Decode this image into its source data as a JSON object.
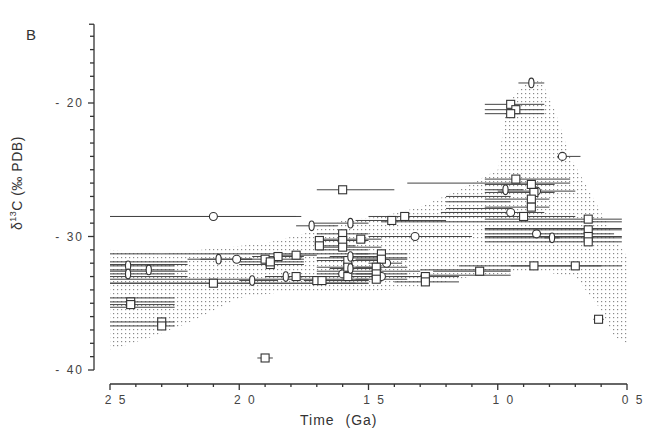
{
  "panel_label": "B",
  "axes": {
    "ylabel_delta": "δ",
    "ylabel_sup": "13",
    "ylabel_rest": "C (‰ PDB)",
    "xlabel": "Time (Ga)"
  },
  "chart_data": {
    "type": "scatter",
    "title": "",
    "panel": "B",
    "xlabel": "Time (Ga)",
    "ylabel": "δ13C (‰ PDB)",
    "xlim": [
      2.5,
      0.5
    ],
    "ylim": [
      -40,
      -14
    ],
    "x_reversed": true,
    "x_ticks": [
      2.5,
      2.0,
      1.5,
      1.0,
      0.5
    ],
    "x_tick_labels": [
      "2 5",
      "2 0",
      "1 5",
      "1 0",
      "0 5"
    ],
    "x_minor_step": 0.1,
    "y_ticks": [
      -20,
      -30,
      -40
    ],
    "y_tick_labels": [
      "- 20",
      "- 30",
      "- 40"
    ],
    "y_minor_step": 1,
    "grid": false,
    "legend": null,
    "envelope": {
      "description": "stippled envelope of organic carbon isotope values",
      "points": [
        [
          2.5,
          -31.0
        ],
        [
          2.3,
          -31.3
        ],
        [
          2.1,
          -30.9
        ],
        [
          1.9,
          -30.5
        ],
        [
          1.75,
          -29.8
        ],
        [
          1.6,
          -28.8
        ],
        [
          1.45,
          -28.5
        ],
        [
          1.3,
          -27.8
        ],
        [
          1.15,
          -26.5
        ],
        [
          1.0,
          -25.0
        ],
        [
          0.97,
          -20.5
        ],
        [
          0.93,
          -19.2
        ],
        [
          0.88,
          -18.3
        ],
        [
          0.83,
          -18.4
        ],
        [
          0.78,
          -20.5
        ],
        [
          0.72,
          -24.0
        ],
        [
          0.62,
          -27.5
        ],
        [
          0.55,
          -30.0
        ],
        [
          0.5,
          -31.5
        ],
        [
          0.5,
          -38.0
        ],
        [
          0.55,
          -37.5
        ],
        [
          0.6,
          -35.5
        ],
        [
          0.7,
          -33.0
        ],
        [
          0.85,
          -32.6
        ],
        [
          1.1,
          -33.0
        ],
        [
          1.3,
          -33.8
        ],
        [
          1.5,
          -34.1
        ],
        [
          1.7,
          -34.2
        ],
        [
          1.85,
          -34.2
        ],
        [
          2.0,
          -34.6
        ],
        [
          2.2,
          -36.5
        ],
        [
          2.35,
          -37.6
        ],
        [
          2.5,
          -38.5
        ]
      ]
    },
    "series": [
      {
        "name": "circles",
        "marker": "circle",
        "points": [
          {
            "x": 2.1,
            "y": -28.5,
            "xmin": 2.5,
            "xmax": 1.76
          },
          {
            "x": 1.32,
            "y": -30.0,
            "xmin": 1.5,
            "xmax": 1.1
          },
          {
            "x": 0.95,
            "y": -28.2,
            "xmin": 1.22,
            "xmax": 0.82
          },
          {
            "x": 0.75,
            "y": -24.0,
            "xmin": 0.77,
            "xmax": 0.68
          },
          {
            "x": 0.85,
            "y": -29.8,
            "xmin": 1.05,
            "xmax": 0.55
          },
          {
            "x": 2.01,
            "y": -31.7,
            "xmin": 2.15,
            "xmax": 1.95
          },
          {
            "x": 1.43,
            "y": -32.0,
            "xmin": 1.5,
            "xmax": 1.37
          },
          {
            "x": 1.45,
            "y": -33.0,
            "xmin": 1.6,
            "xmax": 1.3
          },
          {
            "x": 1.6,
            "y": -32.8,
            "xmin": 1.7,
            "xmax": 1.45
          },
          {
            "x": 0.85,
            "y": -26.6,
            "xmin": 1.0,
            "xmax": 0.7
          }
        ]
      },
      {
        "name": "squares",
        "marker": "square",
        "points": [
          {
            "x": 1.6,
            "y": -26.5,
            "xmin": 1.7,
            "xmax": 1.4
          },
          {
            "x": 0.95,
            "y": -20.1,
            "xmin": 1.05,
            "xmax": 0.82
          },
          {
            "x": 0.93,
            "y": -20.5,
            "xmin": 1.05,
            "xmax": 0.82
          },
          {
            "x": 0.95,
            "y": -20.8,
            "xmin": 1.05,
            "xmax": 0.82
          },
          {
            "x": 0.93,
            "y": -25.7,
            "xmin": 1.05,
            "xmax": 0.72
          },
          {
            "x": 0.87,
            "y": -26.1,
            "xmin": 1.05,
            "xmax": 0.78
          },
          {
            "x": 0.86,
            "y": -26.7,
            "xmin": 1.05,
            "xmax": 0.78
          },
          {
            "x": 0.87,
            "y": -27.2,
            "xmin": 1.05,
            "xmax": 0.8
          },
          {
            "x": 0.87,
            "y": -27.8,
            "xmin": 1.05,
            "xmax": 0.8
          },
          {
            "x": 0.65,
            "y": -28.7,
            "xmin": 1.05,
            "xmax": 0.52
          },
          {
            "x": 0.65,
            "y": -29.5,
            "xmin": 1.05,
            "xmax": 0.52
          },
          {
            "x": 0.65,
            "y": -30.0,
            "xmin": 1.05,
            "xmax": 0.52
          },
          {
            "x": 0.65,
            "y": -30.4,
            "xmin": 1.05,
            "xmax": 0.52
          },
          {
            "x": 0.9,
            "y": -28.5,
            "xmin": 1.2,
            "xmax": 0.7
          },
          {
            "x": 0.7,
            "y": -32.2,
            "xmin": 0.95,
            "xmax": 0.52
          },
          {
            "x": 0.86,
            "y": -32.2,
            "xmin": 1.15,
            "xmax": 0.6
          },
          {
            "x": 1.07,
            "y": -32.6,
            "xmin": 1.25,
            "xmax": 0.95
          },
          {
            "x": 1.28,
            "y": -33.0,
            "xmin": 1.4,
            "xmax": 1.15
          },
          {
            "x": 1.28,
            "y": -33.4,
            "xmin": 1.4,
            "xmax": 1.15
          },
          {
            "x": 1.36,
            "y": -28.5,
            "xmin": 1.5,
            "xmax": 1.2
          },
          {
            "x": 1.41,
            "y": -28.8,
            "xmin": 1.55,
            "xmax": 1.2
          },
          {
            "x": 1.53,
            "y": -30.2,
            "xmin": 1.7,
            "xmax": 1.45
          },
          {
            "x": 1.6,
            "y": -29.8,
            "xmin": 1.7,
            "xmax": 1.5
          },
          {
            "x": 1.6,
            "y": -30.3,
            "xmin": 1.7,
            "xmax": 1.5
          },
          {
            "x": 1.6,
            "y": -30.8,
            "xmin": 1.7,
            "xmax": 1.45
          },
          {
            "x": 1.69,
            "y": -30.3,
            "xmin": 1.7,
            "xmax": 1.55
          },
          {
            "x": 1.69,
            "y": -30.7,
            "xmin": 1.7,
            "xmax": 1.55
          },
          {
            "x": 1.7,
            "y": -33.3,
            "xmin": 1.75,
            "xmax": 1.5
          },
          {
            "x": 1.45,
            "y": -31.3,
            "xmin": 1.55,
            "xmax": 1.35
          },
          {
            "x": 1.45,
            "y": -31.7,
            "xmin": 1.55,
            "xmax": 1.35
          },
          {
            "x": 1.47,
            "y": -32.3,
            "xmin": 1.55,
            "xmax": 1.35
          },
          {
            "x": 1.47,
            "y": -32.8,
            "xmin": 1.55,
            "xmax": 1.35
          },
          {
            "x": 1.47,
            "y": -33.2,
            "xmin": 1.55,
            "xmax": 1.35
          },
          {
            "x": 1.58,
            "y": -31.8,
            "xmin": 1.7,
            "xmax": 1.45
          },
          {
            "x": 1.58,
            "y": -32.3,
            "xmin": 1.7,
            "xmax": 1.45
          },
          {
            "x": 1.58,
            "y": -33.0,
            "xmin": 1.7,
            "xmax": 1.45
          },
          {
            "x": 1.9,
            "y": -31.7,
            "xmin": 2.0,
            "xmax": 1.75
          },
          {
            "x": 1.85,
            "y": -31.5,
            "xmin": 1.95,
            "xmax": 1.75
          },
          {
            "x": 1.78,
            "y": -31.4,
            "xmin": 1.85,
            "xmax": 1.7
          },
          {
            "x": 1.88,
            "y": -32.1,
            "xmin": 2.0,
            "xmax": 1.75
          },
          {
            "x": 1.88,
            "y": -31.9,
            "xmin": 2.0,
            "xmax": 1.75
          },
          {
            "x": 1.78,
            "y": -33.0,
            "xmin": 1.9,
            "xmax": 1.6
          },
          {
            "x": 1.68,
            "y": -33.3,
            "xmin": 1.75,
            "xmax": 1.5
          },
          {
            "x": 2.42,
            "y": -34.9,
            "xmin": 2.5,
            "xmax": 2.25
          },
          {
            "x": 2.42,
            "y": -35.1,
            "xmin": 2.5,
            "xmax": 2.25
          },
          {
            "x": 2.3,
            "y": -36.4,
            "xmin": 2.5,
            "xmax": 2.25
          },
          {
            "x": 2.3,
            "y": -36.7,
            "xmin": 2.5,
            "xmax": 2.25
          },
          {
            "x": 2.1,
            "y": -33.5,
            "xmin": 2.5,
            "xmax": 1.5
          },
          {
            "x": 0.61,
            "y": -36.2,
            "xmin": 0.63,
            "xmax": 0.59
          },
          {
            "x": 1.9,
            "y": -39.1,
            "xmin": 1.93,
            "xmax": 1.87
          }
        ]
      },
      {
        "name": "diamonds",
        "marker": "diamond",
        "points": [
          {
            "x": 0.87,
            "y": -18.5,
            "xmin": 0.92,
            "xmax": 0.82
          },
          {
            "x": 2.43,
            "y": -32.2,
            "xmin": 2.5,
            "xmax": 2.25
          },
          {
            "x": 2.43,
            "y": -32.8,
            "xmin": 2.5,
            "xmax": 2.25
          },
          {
            "x": 2.35,
            "y": -32.5,
            "xmin": 2.5,
            "xmax": 2.25
          },
          {
            "x": 2.08,
            "y": -31.7,
            "xmin": 2.2,
            "xmax": 1.95
          },
          {
            "x": 1.82,
            "y": -33.0,
            "xmin": 1.9,
            "xmax": 1.75
          },
          {
            "x": 1.72,
            "y": -29.2,
            "xmin": 1.78,
            "xmax": 1.62
          },
          {
            "x": 1.57,
            "y": -29.0,
            "xmin": 1.72,
            "xmax": 1.5
          },
          {
            "x": 1.57,
            "y": -31.5,
            "xmin": 1.65,
            "xmax": 1.45
          },
          {
            "x": 1.57,
            "y": -32.4,
            "xmin": 1.65,
            "xmax": 1.45
          },
          {
            "x": 1.95,
            "y": -33.3,
            "xmin": 2.0,
            "xmax": 1.85
          },
          {
            "x": 0.97,
            "y": -26.5,
            "xmin": 1.05,
            "xmax": 0.9
          },
          {
            "x": 0.79,
            "y": -30.1,
            "xmin": 0.82,
            "xmax": 0.76
          }
        ]
      }
    ],
    "extra_ranges": [
      {
        "y": -28.5,
        "xmin": 2.5,
        "xmax": 1.78
      },
      {
        "y": -26.0,
        "xmin": 1.35,
        "xmax": 0.72
      },
      {
        "y": -28.9,
        "xmin": 1.45,
        "xmax": 0.52
      },
      {
        "y": -29.4,
        "xmin": 1.05,
        "xmax": 0.52
      },
      {
        "y": -30.1,
        "xmin": 1.05,
        "xmax": 0.52
      },
      {
        "y": -31.3,
        "xmin": 2.5,
        "xmax": 1.5
      },
      {
        "y": -31.9,
        "xmin": 2.5,
        "xmax": 2.2
      },
      {
        "y": -32.1,
        "xmin": 2.5,
        "xmax": 2.2
      },
      {
        "y": -32.6,
        "xmin": 2.5,
        "xmax": 2.2
      },
      {
        "y": -33.0,
        "xmin": 2.5,
        "xmax": 2.2
      },
      {
        "y": -33.2,
        "xmin": 2.5,
        "xmax": 1.5
      },
      {
        "y": -33.5,
        "xmin": 2.5,
        "xmax": 1.5
      },
      {
        "y": -34.6,
        "xmin": 2.5,
        "xmax": 2.25
      },
      {
        "y": -35.3,
        "xmin": 2.5,
        "xmax": 2.25
      },
      {
        "y": -27.0,
        "xmin": 1.2,
        "xmax": 0.95
      },
      {
        "y": -27.4,
        "xmin": 1.2,
        "xmax": 0.95
      },
      {
        "y": -27.9,
        "xmin": 1.2,
        "xmax": 0.95
      },
      {
        "y": -28.2,
        "xmin": 1.2,
        "xmax": 0.95
      },
      {
        "y": -31.0,
        "xmin": 1.7,
        "xmax": 1.5
      },
      {
        "y": -31.6,
        "xmin": 1.7,
        "xmax": 1.35
      },
      {
        "y": -32.6,
        "xmin": 1.7,
        "xmax": 1.3
      },
      {
        "y": -32.5,
        "xmin": 1.3,
        "xmax": 0.95
      },
      {
        "y": -32.9,
        "xmin": 1.3,
        "xmax": 0.95
      },
      {
        "y": -33.5,
        "xmin": 1.7,
        "xmax": 1.55
      }
    ]
  }
}
